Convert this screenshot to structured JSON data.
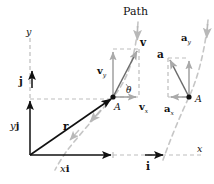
{
  "figure": {
    "title": "Path",
    "colors": {
      "solid_stroke": "#111111",
      "dashed_guide": "#bdbdbd",
      "path_curve": "#c2c2c2",
      "text": "#111111"
    }
  },
  "labels": {
    "path": "Path",
    "axis_y": "y",
    "axis_x": "x",
    "unit_vector_i": "i",
    "unit_vector_j": "j",
    "position_vector": "r",
    "component_xi": "x",
    "component_xi_unit": "i",
    "component_yj": "y",
    "component_yj_unit": "j",
    "point_a_velocity": "A",
    "point_a_acceleration": "A",
    "theta": "θ",
    "velocity": "v",
    "velocity_y": "v",
    "velocity_y_sub": "y",
    "velocity_x": "v",
    "velocity_x_sub": "x",
    "acceleration": "a",
    "acceleration_y": "a",
    "acceleration_y_sub": "y",
    "acceleration_x": "a",
    "acceleration_x_sub": "x"
  },
  "geometry": {
    "origin": {
      "x": 30,
      "y": 155
    },
    "point_a_velocity": {
      "x": 113,
      "y": 97
    },
    "point_a_acceleration": {
      "x": 189,
      "y": 97
    },
    "velocity_tip": {
      "x": 139,
      "y": 49
    },
    "acceleration_tip": {
      "x": 169,
      "y": 58
    },
    "x_component_end": {
      "x": 113,
      "y": 155
    },
    "y_component_top": {
      "x": 30,
      "y": 99
    }
  }
}
